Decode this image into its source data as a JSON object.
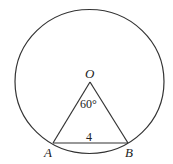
{
  "diagram": {
    "type": "circle-geometry",
    "circle": {
      "cx": 89.5,
      "cy": 81.5,
      "rx": 74.5,
      "ry": 72
    },
    "points": {
      "O": {
        "label": "O",
        "x": 90,
        "y": 82
      },
      "A": {
        "label": "A",
        "x": 53,
        "y": 143
      },
      "B": {
        "label": "B",
        "x": 128,
        "y": 143
      }
    },
    "labels": {
      "center": "O",
      "point_a": "A",
      "point_b": "B",
      "angle": "60°",
      "chord_length": "4"
    },
    "colors": {
      "stroke": "#333333",
      "text": "#222222",
      "background": "#ffffff"
    }
  }
}
